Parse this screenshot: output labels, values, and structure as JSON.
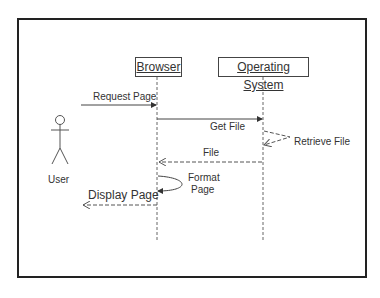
{
  "diagram": {
    "type": "sequence",
    "actor": {
      "label": "User"
    },
    "objects": [
      {
        "label": "Browser"
      },
      {
        "label": "Operating System"
      }
    ],
    "messages": [
      {
        "from": "User",
        "to": "Browser",
        "label": "Request Page",
        "style": "solid"
      },
      {
        "from": "Browser",
        "to": "Operating System",
        "label": "Get File",
        "style": "solid"
      },
      {
        "from": "Operating System",
        "to": "Operating System",
        "label": "Retrieve File",
        "style": "dashed-self"
      },
      {
        "from": "Operating System",
        "to": "Browser",
        "label": "File",
        "style": "dashed"
      },
      {
        "from": "Browser",
        "to": "Browser",
        "label_line1": "Format",
        "label_line2": "Page",
        "style": "solid-self"
      },
      {
        "from": "Browser",
        "to": "User",
        "label": "Display Page",
        "style": "dashed"
      }
    ]
  }
}
